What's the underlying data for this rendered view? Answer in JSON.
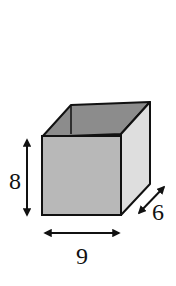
{
  "figure": {
    "shape": "rectangular prism (open-top box)",
    "dimensions": {
      "height": {
        "label": "8"
      },
      "width": {
        "label": "9"
      },
      "depth": {
        "label": "6"
      }
    },
    "colors": {
      "front_face": "#b8b8b8",
      "top_face": "#8c8c8c",
      "right_face": "#dedede",
      "edge": "#111111",
      "arrow": "#111111",
      "background": "#ffffff"
    }
  }
}
